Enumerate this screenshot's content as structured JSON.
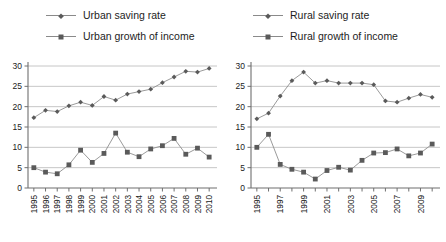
{
  "chart_data": [
    {
      "panel": "left",
      "type": "line",
      "title": "",
      "xlabel": "",
      "ylabel": "",
      "ylim": [
        0,
        30
      ],
      "yticks": [
        0,
        5,
        10,
        15,
        20,
        25,
        30
      ],
      "grid": true,
      "legend_position": "top",
      "categories": [
        "1995",
        "1996",
        "1997",
        "1998",
        "1999",
        "2000",
        "2001",
        "2002",
        "2003",
        "2004",
        "2005",
        "2006",
        "2007",
        "2008",
        "2009",
        "2010"
      ],
      "tick_labels": [
        "1995",
        "1996",
        "1997",
        "1998",
        "1999",
        "2000",
        "2001",
        "2002",
        "2003",
        "2004",
        "2005",
        "2006",
        "2007",
        "2008",
        "2009",
        "2010"
      ],
      "series": [
        {
          "name": "Urban saving rate",
          "marker": "diamond",
          "color": "#5a5a5a",
          "values": [
            17.3,
            19.1,
            18.8,
            20.2,
            21.1,
            20.3,
            22.5,
            21.6,
            23.1,
            23.7,
            24.3,
            25.9,
            27.3,
            28.7,
            28.5,
            29.4
          ]
        },
        {
          "name": "Urban growth of income",
          "marker": "square",
          "color": "#5a5a5a",
          "values": [
            5.0,
            3.9,
            3.5,
            5.7,
            9.3,
            6.3,
            8.5,
            13.5,
            8.8,
            7.7,
            9.6,
            10.4,
            12.2,
            8.3,
            9.8,
            7.6
          ]
        }
      ]
    },
    {
      "panel": "right",
      "type": "line",
      "title": "",
      "xlabel": "",
      "ylabel": "",
      "ylim": [
        0,
        30
      ],
      "yticks": [
        0,
        5,
        10,
        15,
        20,
        25,
        30
      ],
      "grid": true,
      "legend_position": "top",
      "categories": [
        "1995",
        "1996",
        "1997",
        "1998",
        "1999",
        "2000",
        "2001",
        "2002",
        "2003",
        "2004",
        "2005",
        "2006",
        "2007",
        "2008",
        "2009",
        "2010"
      ],
      "tick_labels": [
        "1995",
        "",
        "1997",
        "",
        "1999",
        "",
        "2001",
        "",
        "2003",
        "",
        "2005",
        "",
        "2007",
        "",
        "2009",
        ""
      ],
      "series": [
        {
          "name": "Rural saving rate",
          "marker": "diamond",
          "color": "#5a5a5a",
          "values": [
            17.0,
            18.4,
            22.6,
            26.4,
            28.5,
            25.8,
            26.4,
            25.8,
            25.8,
            25.8,
            25.4,
            21.4,
            21.1,
            22.1,
            23.0,
            22.3
          ]
        },
        {
          "name": "Rural growth of income",
          "marker": "square",
          "color": "#5a5a5a",
          "values": [
            10.0,
            13.2,
            5.8,
            4.6,
            3.9,
            2.2,
            4.3,
            5.1,
            4.4,
            6.8,
            8.6,
            8.7,
            9.6,
            7.9,
            8.6,
            10.8
          ]
        }
      ]
    }
  ],
  "left_panel": {
    "legend": [
      {
        "label": "Urban saving rate",
        "marker": "diamond"
      },
      {
        "label": "Urban growth of income",
        "marker": "square"
      }
    ]
  },
  "right_panel": {
    "legend": [
      {
        "label": "Rural saving rate",
        "marker": "diamond"
      },
      {
        "label": "Rural growth of income",
        "marker": "square"
      }
    ]
  },
  "right_extra": {
    "saving_rate_tail": [
      22.3,
      25.8
    ],
    "growth_tail": [
      10.8
    ]
  }
}
